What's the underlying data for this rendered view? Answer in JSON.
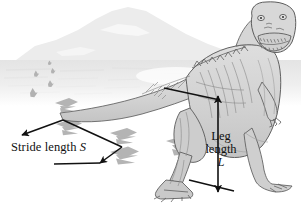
{
  "figure": {
    "background_color": "#ffffff"
  },
  "annotations": {
    "stride": {
      "text_plain": "Stride length",
      "symbol": "S",
      "full": "Stride length S"
    },
    "leg": {
      "line1": "Leg",
      "line2": "length",
      "symbol": "L",
      "full": "Leg length L"
    }
  },
  "scene": {
    "mountain_color": "#ececec",
    "ground_haze_color": "#f1f1f1",
    "footprint_color": "#b5b5b5",
    "body_fill": "#d2d2d2",
    "body_outline": "#5a5a5a",
    "arrow_color": "#111111",
    "footprints_near": 3,
    "footprints_far": 5
  }
}
